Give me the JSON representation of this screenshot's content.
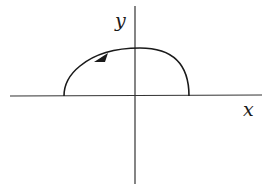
{
  "diagram": {
    "type": "coordinate-plane-curve",
    "axes": {
      "x_label": "x",
      "y_label": "y"
    },
    "curve": {
      "description": "Closed-looking arc in upper half-plane starting on positive x-axis, rising through the y-axis, and ending on negative x-axis",
      "start": "positive x-axis",
      "end": "negative x-axis",
      "direction": "counterclockwise",
      "arrow": "arrowhead on upper-left portion pointing left"
    },
    "colors": {
      "stroke": "#1a1a1a",
      "axis": "#333333",
      "background": "#ffffff"
    }
  }
}
